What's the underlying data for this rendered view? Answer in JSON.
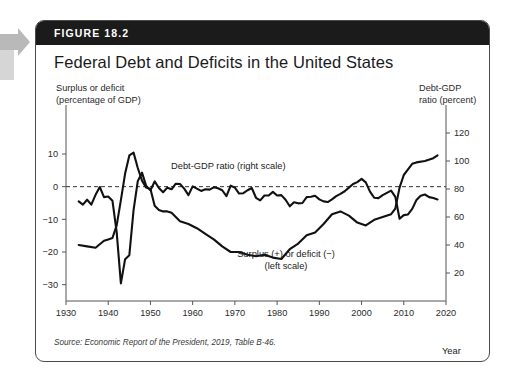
{
  "figure": {
    "number_label": "FIGURE 18.2",
    "title": "Federal Debt and Deficits in the United States",
    "source": "Source: Economic Report of the President, 2019, Table B-46.",
    "left_axis_caption": "Surplus or deficit\n(percentage of GDP)",
    "right_axis_caption": "Debt-GDP\nratio (percent)",
    "x_axis_title": "Year",
    "annotation_debt": "Debt-GDP ratio (right scale)",
    "annotation_deficit": "Surplus (+) or deficit (−)\n(left scale)"
  },
  "colors": {
    "header_bar": "#1b1b1b",
    "border": "#4a4a4a",
    "line": "#111111",
    "axis": "#555555",
    "zero_line": "#333333",
    "page_tab": "#b9b9b9"
  },
  "chart_data": {
    "type": "line",
    "title": "Federal Debt and Deficits in the United States",
    "xlabel": "Year",
    "ylabel": "Surplus or deficit (percentage of GDP)",
    "y2label": "Debt-GDP ratio (percent)",
    "grid": false,
    "legend_position": "inline-annotations",
    "xlim": [
      1930,
      2020
    ],
    "xticks": [
      1930,
      1940,
      1950,
      1960,
      1970,
      1980,
      1990,
      2000,
      2010,
      2020
    ],
    "ylim": [
      -35,
      25
    ],
    "yticks": [
      -30,
      -20,
      -10,
      0,
      10
    ],
    "y2lim": [
      0,
      140
    ],
    "y2ticks": [
      20,
      40,
      60,
      80,
      100,
      120
    ],
    "zero_reference_line": 0,
    "series": [
      {
        "name": "Debt-GDP ratio (right scale)",
        "axis": "right",
        "x": [
          1933,
          1935,
          1937,
          1939,
          1940,
          1941,
          1942,
          1943,
          1944,
          1945,
          1946,
          1947,
          1948,
          1949,
          1950,
          1951,
          1952,
          1953,
          1954,
          1955,
          1957,
          1959,
          1961,
          1963,
          1965,
          1967,
          1969,
          1971,
          1973,
          1975,
          1977,
          1979,
          1981,
          1983,
          1985,
          1987,
          1989,
          1991,
          1993,
          1995,
          1997,
          1999,
          2001,
          2003,
          2005,
          2007,
          2008,
          2009,
          2010,
          2011,
          2012,
          2013,
          2015,
          2017,
          2018
        ],
        "values": [
          40,
          39,
          38,
          43,
          44,
          45,
          54,
          72,
          91,
          104,
          106,
          95,
          86,
          81,
          80,
          68,
          65,
          64,
          64,
          63,
          57,
          55,
          52,
          48,
          44,
          39,
          35,
          35,
          33,
          32,
          33,
          31,
          30,
          37,
          41,
          47,
          49,
          55,
          62,
          64,
          61,
          56,
          54,
          58,
          60,
          62,
          66,
          81,
          90,
          94,
          98,
          99,
          100,
          102,
          104
        ],
        "label_position": {
          "x": 1965,
          "y": 96
        }
      },
      {
        "name": "Surplus (+) or deficit (−) (left scale)",
        "axis": "left",
        "x": [
          1933,
          1934,
          1935,
          1936,
          1937,
          1938,
          1939,
          1940,
          1941,
          1942,
          1943,
          1944,
          1945,
          1946,
          1947,
          1948,
          1949,
          1950,
          1951,
          1952,
          1953,
          1954,
          1955,
          1956,
          1957,
          1958,
          1959,
          1960,
          1961,
          1962,
          1963,
          1964,
          1965,
          1966,
          1967,
          1968,
          1969,
          1970,
          1971,
          1972,
          1973,
          1974,
          1975,
          1976,
          1977,
          1978,
          1979,
          1980,
          1981,
          1982,
          1983,
          1984,
          1985,
          1986,
          1987,
          1988,
          1989,
          1990,
          1991,
          1992,
          1993,
          1994,
          1995,
          1996,
          1997,
          1998,
          1999,
          2000,
          2001,
          2002,
          2003,
          2004,
          2005,
          2006,
          2007,
          2008,
          2009,
          2010,
          2011,
          2012,
          2013,
          2014,
          2015,
          2016,
          2017,
          2018
        ],
        "values": [
          -4.5,
          -5.5,
          -4.0,
          -5.5,
          -2.5,
          -0.1,
          -3.2,
          -3.0,
          -4.3,
          -13.9,
          -29.6,
          -22.2,
          -21.0,
          -7.2,
          1.7,
          4.3,
          0.2,
          -1.1,
          1.6,
          -0.4,
          -1.7,
          -0.3,
          -0.8,
          0.9,
          0.8,
          -0.6,
          -2.6,
          0.1,
          -0.6,
          -1.3,
          -0.8,
          -0.9,
          -0.2,
          -0.5,
          -1.1,
          -2.9,
          0.3,
          -0.3,
          -2.1,
          -2.0,
          -1.1,
          -0.4,
          -3.4,
          -4.2,
          -2.7,
          -2.7,
          -1.6,
          -2.7,
          -2.6,
          -4.0,
          -6.0,
          -4.8,
          -5.1,
          -5.0,
          -3.2,
          -3.1,
          -2.8,
          -3.9,
          -4.5,
          -4.7,
          -3.9,
          -2.9,
          -2.2,
          -1.4,
          -0.3,
          0.8,
          1.4,
          2.4,
          1.3,
          -1.5,
          -3.4,
          -3.5,
          -2.6,
          -1.9,
          -1.2,
          -3.1,
          -9.8,
          -8.7,
          -8.5,
          -6.8,
          -4.1,
          -2.8,
          -2.4,
          -3.2,
          -3.5,
          -3.9
        ],
        "label_position": {
          "x": 1981,
          "y": -14
        }
      }
    ]
  }
}
